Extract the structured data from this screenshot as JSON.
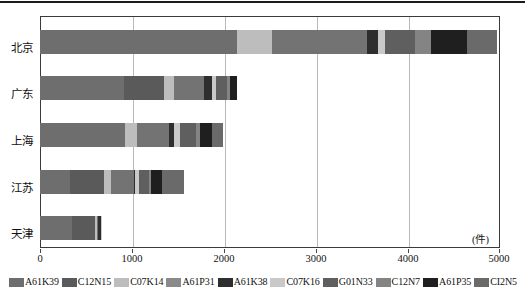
{
  "chart_data": {
    "type": "bar",
    "orientation": "horizontal",
    "stacked": true,
    "title": "",
    "xlabel": "(件)",
    "ylabel": "",
    "xlim": [
      0,
      5000
    ],
    "grid": true,
    "legend_position": "bottom",
    "categories": [
      "北京",
      "广东",
      "上海",
      "江苏",
      "天津"
    ],
    "xticks": [
      "0",
      "1000",
      "2000",
      "3000",
      "4000",
      "5000"
    ],
    "xtick_values": [
      0,
      1000,
      2000,
      3000,
      4000,
      5000
    ],
    "unit": "(件)",
    "series": [
      {
        "name": "A61K39",
        "color": "#6e6e6e",
        "values": [
          2150,
          920,
          930,
          330,
          345
        ]
      },
      {
        "name": "C12N15",
        "color": "#5a5a5a",
        "values": [
          0,
          430,
          0,
          370,
          255
        ]
      },
      {
        "name": "C07K14",
        "color": "#bdbdbd",
        "values": [
          380,
          105,
          130,
          70,
          20
        ]
      },
      {
        "name": "A61P31",
        "color": "#737373",
        "values": [
          1030,
          330,
          350,
          250,
          15
        ]
      },
      {
        "name": "A61K38",
        "color": "#2e2e2e",
        "values": [
          120,
          90,
          55,
          20,
          25
        ]
      },
      {
        "name": "C07K16",
        "color": "#c9c9c9",
        "values": [
          80,
          45,
          60,
          40,
          8
        ]
      },
      {
        "name": "G01N33",
        "color": "#5f5f5f",
        "values": [
          330,
          120,
          170,
          105,
          0
        ]
      },
      {
        "name": "C12N7",
        "color": "#848484",
        "values": [
          170,
          30,
          50,
          20,
          0
        ]
      },
      {
        "name": "A61P35",
        "color": "#1f1f1f",
        "values": [
          390,
          80,
          130,
          125,
          0
        ]
      },
      {
        "name": "CI2N5",
        "color": "#6a6a6a",
        "values": [
          330,
          0,
          115,
          240,
          0
        ]
      }
    ],
    "totals": [
      4980,
      2150,
      1990,
      1570,
      668
    ]
  },
  "axis": {
    "xticks": [
      {
        "label": "0",
        "value": 0
      },
      {
        "label": "1000",
        "value": 1000
      },
      {
        "label": "2000",
        "value": 2000
      },
      {
        "label": "3000",
        "value": 3000
      },
      {
        "label": "4000",
        "value": 4000
      },
      {
        "label": "5000",
        "value": 5000
      }
    ],
    "unit_label": "(件)"
  },
  "legend": {
    "items": [
      {
        "label": "A61K39",
        "color": "#6e6e6e"
      },
      {
        "label": "C12N15",
        "color": "#5a5a5a"
      },
      {
        "label": "C07K14",
        "color": "#bdbdbd"
      },
      {
        "label": "A61P31",
        "color": "#8a8a8a"
      },
      {
        "label": "A61K38",
        "color": "#2e2e2e"
      },
      {
        "label": "C07K16",
        "color": "#c9c9c9"
      },
      {
        "label": "G01N33",
        "color": "#5f5f5f"
      },
      {
        "label": "C12N7",
        "color": "#848484"
      },
      {
        "label": "A61P35",
        "color": "#1f1f1f"
      },
      {
        "label": "CI2N5",
        "color": "#6a6a6a"
      }
    ]
  }
}
